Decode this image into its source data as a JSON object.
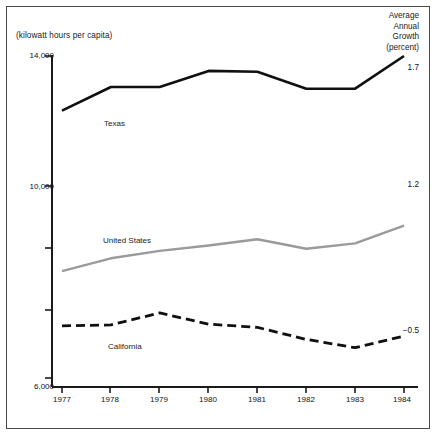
{
  "figure": {
    "unit_label": "(kilowatt hours per capita)",
    "corner_header_lines": [
      "Average",
      "Annual",
      "Growth",
      "(percent)"
    ]
  },
  "axes": {
    "y_tick_labels": [
      "14,000",
      "10,000",
      "6,000"
    ],
    "x_tick_labels": [
      "1977",
      "1978",
      "1979",
      "1980",
      "1981",
      "1982",
      "1983",
      "1984"
    ],
    "y_min": 6000,
    "y_max": 14000
  },
  "series_labels": {
    "texas": "Texas",
    "united_states": "United States",
    "california": "California"
  },
  "growth_values": {
    "texas": "1.7",
    "united_states": "1.2",
    "california": "−0.5"
  },
  "colors": {
    "texas": "#101010",
    "united_states": "#9a9a9a",
    "california": "#101010",
    "axis": "#1a1a1a",
    "border": "#4a4a4a",
    "background": "#ffffff"
  },
  "chart_data": {
    "type": "line",
    "title": "",
    "xlabel": "",
    "ylabel": "(kilowatt hours per capita)",
    "x": [
      1977,
      1978,
      1979,
      1980,
      1981,
      1982,
      1983,
      1984
    ],
    "ylim": [
      6000,
      14000
    ],
    "yticks": [
      6000,
      10000,
      14000
    ],
    "ytick_labels": [
      "6,000",
      "10,000",
      "14,000"
    ],
    "grid": false,
    "legend": "inline-labels",
    "annotations": [
      {
        "text": "Average Annual Growth (percent)",
        "position": "top-right"
      },
      {
        "text": "1.7",
        "series": "Texas",
        "position": "right-end"
      },
      {
        "text": "1.2",
        "series": "United States",
        "position": "right-end"
      },
      {
        "text": "−0.5",
        "series": "California",
        "position": "right-end"
      }
    ],
    "series": [
      {
        "name": "Texas",
        "style": "solid-thick",
        "color": "#101010",
        "values": [
          12680,
          13250,
          13250,
          13640,
          13620,
          13210,
          13210,
          14000
        ]
      },
      {
        "name": "United States",
        "style": "solid",
        "color": "#9a9a9a",
        "values": [
          8800,
          9110,
          9290,
          9420,
          9570,
          9340,
          9470,
          9900
        ]
      },
      {
        "name": "California",
        "style": "dashed",
        "color": "#101010",
        "values": [
          7480,
          7500,
          7790,
          7520,
          7440,
          7150,
          6950,
          7230
        ]
      }
    ]
  }
}
